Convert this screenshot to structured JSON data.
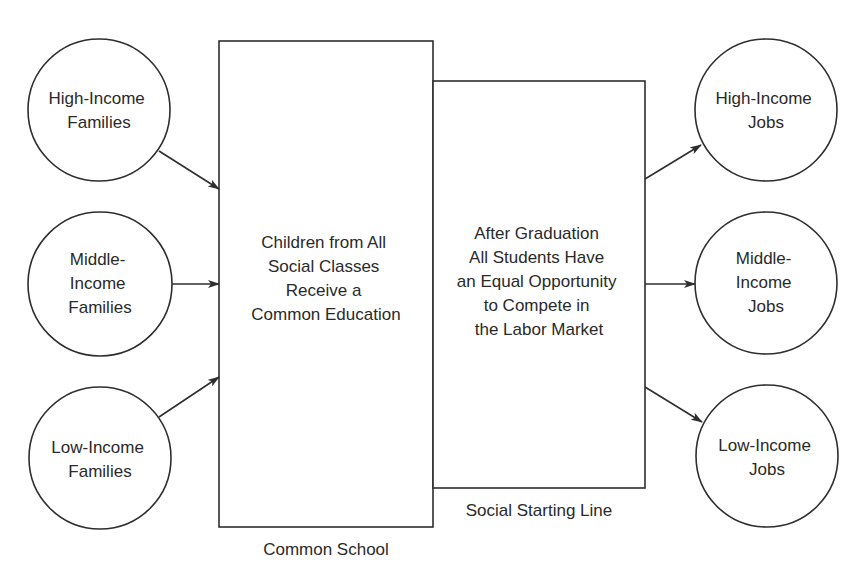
{
  "diagram": {
    "type": "flow",
    "sources": [
      {
        "id": "high-income-families",
        "lines": [
          "High-Income",
          "Families"
        ]
      },
      {
        "id": "middle-income-families",
        "lines": [
          "Middle-",
          "Income",
          "Families"
        ]
      },
      {
        "id": "low-income-families",
        "lines": [
          "Low-Income",
          "Families"
        ]
      }
    ],
    "common_school": {
      "lines": [
        "Children from All",
        "Social Classes",
        "Receive a",
        "Common Education"
      ],
      "caption": "Common School"
    },
    "starting_line": {
      "lines": [
        "After Graduation",
        "All Students Have",
        "an Equal Opportunity",
        "to Compete in",
        "the Labor Market"
      ],
      "caption": "Social Starting Line"
    },
    "targets": [
      {
        "id": "high-income-jobs",
        "lines": [
          "High-Income",
          "Jobs"
        ]
      },
      {
        "id": "middle-income-jobs",
        "lines": [
          "Middle-",
          "Income",
          "Jobs"
        ]
      },
      {
        "id": "low-income-jobs",
        "lines": [
          "Low-Income",
          "Jobs"
        ]
      }
    ],
    "edges": [
      {
        "from": "high-income-families",
        "to": "common-school"
      },
      {
        "from": "middle-income-families",
        "to": "common-school"
      },
      {
        "from": "low-income-families",
        "to": "common-school"
      },
      {
        "from": "social-starting-line",
        "to": "high-income-jobs"
      },
      {
        "from": "social-starting-line",
        "to": "middle-income-jobs"
      },
      {
        "from": "social-starting-line",
        "to": "low-income-jobs"
      }
    ],
    "colors": {
      "stroke": "#2e2e2e",
      "text": "#2a2a2a",
      "background": "#ffffff"
    }
  }
}
